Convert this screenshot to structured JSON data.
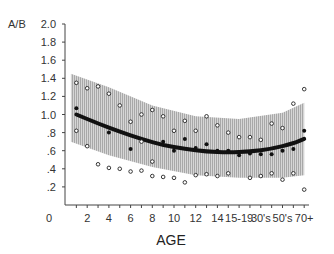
{
  "chart_data": {
    "type": "scatter",
    "title": "",
    "xlabel": "AGE",
    "ylabel": "A/B",
    "ylim": [
      0,
      2.0
    ],
    "yticks": [
      ".2",
      ".4",
      ".6",
      ".8",
      "1.0",
      "1.2",
      "1.4",
      "1.6",
      "1.8",
      "2.0"
    ],
    "y_zero_label": "0",
    "x_positions": 22,
    "x_tick_labels": [
      {
        "pos": 2,
        "label": "2"
      },
      {
        "pos": 4,
        "label": "4"
      },
      {
        "pos": 6,
        "label": "6"
      },
      {
        "pos": 8,
        "label": "8"
      },
      {
        "pos": 10,
        "label": "10"
      },
      {
        "pos": 12,
        "label": "12"
      },
      {
        "pos": 14,
        "label": "14"
      },
      {
        "pos": 16,
        "label": "15-19"
      },
      {
        "pos": 18,
        "label": "30's"
      },
      {
        "pos": 20,
        "label": "50's"
      },
      {
        "pos": 22,
        "label": "70+"
      }
    ],
    "x_zero_label": "0",
    "grid": false,
    "legend": null,
    "series": [
      {
        "name": "fitted-mean",
        "kind": "line",
        "points": [
          [
            1,
            1.0
          ],
          [
            3,
            0.9
          ],
          [
            5,
            0.81
          ],
          [
            7,
            0.73
          ],
          [
            9,
            0.66
          ],
          [
            11,
            0.62
          ],
          [
            13,
            0.59
          ],
          [
            15,
            0.58
          ],
          [
            17,
            0.59
          ],
          [
            19,
            0.62
          ],
          [
            21,
            0.68
          ],
          [
            22,
            0.73
          ]
        ]
      },
      {
        "name": "confidence-band",
        "kind": "area",
        "upper": [
          [
            0.5,
            1.45
          ],
          [
            4,
            1.3
          ],
          [
            8,
            1.1
          ],
          [
            12,
            0.98
          ],
          [
            16,
            0.95
          ],
          [
            20,
            1.02
          ],
          [
            22,
            1.13
          ]
        ],
        "lower": [
          [
            0.5,
            0.7
          ],
          [
            4,
            0.55
          ],
          [
            8,
            0.42
          ],
          [
            12,
            0.33
          ],
          [
            16,
            0.3
          ],
          [
            20,
            0.3
          ],
          [
            22,
            0.33
          ]
        ]
      },
      {
        "name": "mean-values",
        "kind": "filled",
        "points": [
          [
            1,
            1.07
          ],
          [
            4,
            0.8
          ],
          [
            6,
            0.62
          ],
          [
            9,
            0.7
          ],
          [
            10,
            0.6
          ],
          [
            11,
            0.73
          ],
          [
            12,
            0.63
          ],
          [
            13,
            0.67
          ],
          [
            14,
            0.6
          ],
          [
            15,
            0.6
          ],
          [
            16,
            0.55
          ],
          [
            17,
            0.57
          ],
          [
            18,
            0.56
          ],
          [
            19,
            0.56
          ],
          [
            20,
            0.6
          ],
          [
            21,
            0.62
          ],
          [
            22,
            0.82
          ]
        ]
      },
      {
        "name": "individual-range",
        "kind": "open",
        "points": [
          [
            1,
            1.35
          ],
          [
            2,
            1.29
          ],
          [
            3,
            1.31
          ],
          [
            4,
            1.23
          ],
          [
            5,
            1.1
          ],
          [
            1,
            0.82
          ],
          [
            2,
            0.65
          ],
          [
            3,
            0.45
          ],
          [
            4,
            0.41
          ],
          [
            5,
            0.4
          ],
          [
            6,
            0.92
          ],
          [
            7,
            1.0
          ],
          [
            8,
            1.05
          ],
          [
            7,
            0.7
          ],
          [
            8,
            0.48
          ],
          [
            6,
            0.37
          ],
          [
            7,
            0.38
          ],
          [
            8,
            0.32
          ],
          [
            9,
            0.98
          ],
          [
            10,
            0.82
          ],
          [
            11,
            0.93
          ],
          [
            9,
            0.31
          ],
          [
            10,
            0.3
          ],
          [
            11,
            0.25
          ],
          [
            12,
            0.33
          ],
          [
            13,
            0.98
          ],
          [
            14,
            0.88
          ],
          [
            12,
            0.82
          ],
          [
            15,
            0.8
          ],
          [
            16,
            0.75
          ],
          [
            13,
            0.34
          ],
          [
            14,
            0.32
          ],
          [
            15,
            0.35
          ],
          [
            17,
            0.75
          ],
          [
            18,
            0.72
          ],
          [
            19,
            0.9
          ],
          [
            20,
            0.85
          ],
          [
            17,
            0.3
          ],
          [
            18,
            0.32
          ],
          [
            19,
            0.35
          ],
          [
            20,
            0.28
          ],
          [
            21,
            1.12
          ],
          [
            22,
            1.28
          ],
          [
            21,
            0.35
          ],
          [
            22,
            0.17
          ]
        ]
      }
    ]
  },
  "axes": {
    "ylabel": "A/B",
    "xlabel": "AGE"
  }
}
